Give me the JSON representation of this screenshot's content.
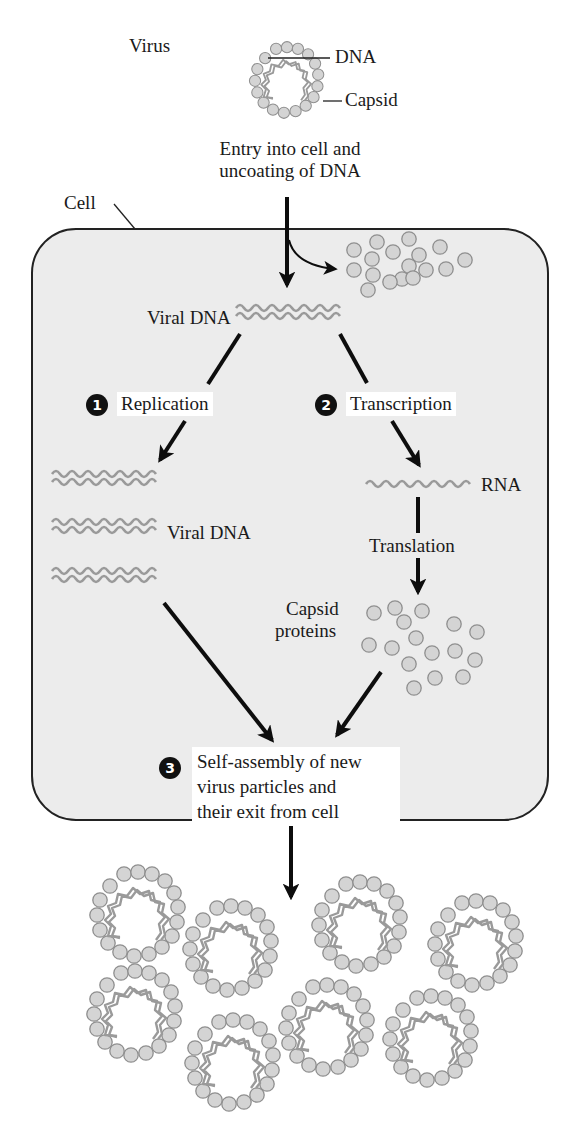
{
  "colors": {
    "cell_fill": "#ececec",
    "cell_stroke": "#222222",
    "protein_fill": "#d4d4d4",
    "protein_stroke": "#8f8f8f",
    "dna_stroke": "#9a9a9a",
    "arrow": "#0d0d0d",
    "label_box": "#ffffff"
  },
  "virus": {
    "label": "Virus",
    "dna_label": "DNA",
    "capsid_label": "Capsid"
  },
  "entry": {
    "line1": "Entry into cell and",
    "line2": "uncoating of DNA"
  },
  "cell": {
    "label": "Cell"
  },
  "viral_dna": {
    "label": "Viral DNA"
  },
  "steps": [
    {
      "number": "1",
      "label": "Replication"
    },
    {
      "number": "2",
      "label": "Transcription"
    },
    {
      "number": "3",
      "lines": [
        "Self-assembly of new",
        "virus particles and",
        "their exit from cell"
      ]
    }
  ],
  "replicated_dna": {
    "label": "Viral DNA"
  },
  "rna": {
    "label": "RNA"
  },
  "translation": {
    "label": "Translation"
  },
  "capsid_proteins": {
    "line1": "Capsid",
    "line2": "proteins"
  },
  "released_virions": {
    "count": 8
  }
}
